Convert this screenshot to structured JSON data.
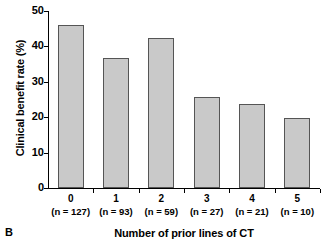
{
  "panel": {
    "label": "B"
  },
  "chart_data": {
    "type": "bar",
    "title": "",
    "xlabel": "Number of prior lines of CT",
    "ylabel": "Clinical benefit rate (%)",
    "categories": [
      "0",
      "1",
      "2",
      "3",
      "4",
      "5"
    ],
    "group_sizes": [
      "(n = 127)",
      "(n = 93)",
      "(n = 59)",
      "(n = 27)",
      "(n = 21)",
      "(n = 10)"
    ],
    "values": [
      46,
      36.8,
      42.5,
      25.8,
      23.7,
      19.8
    ],
    "ylim": [
      0,
      50
    ],
    "ytick_labels": [
      "0",
      "10",
      "20",
      "30",
      "40",
      "50"
    ],
    "ytick_values": [
      0,
      10,
      20,
      30,
      40,
      50
    ],
    "grid": false,
    "legend": "none",
    "bar_fill_color": "#c9c9c9",
    "bar_edge_color": "#555555",
    "axis_color": "#000000"
  }
}
